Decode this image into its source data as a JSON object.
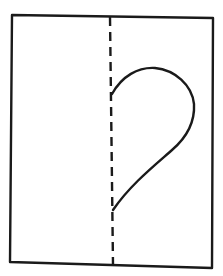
{
  "diagram": {
    "description": "Folded paper with half-heart outline drawn against the fold line",
    "stroke_color": "#1a1a1a",
    "background_color": "#ffffff",
    "paper": {
      "label": "paper-sheet",
      "corners": [
        [
          12,
          14
        ],
        [
          213,
          18
        ],
        [
          212,
          268
        ],
        [
          10,
          262
        ]
      ]
    },
    "fold_line": {
      "label": "fold-line",
      "style": "dashed",
      "from": [
        110,
        17
      ],
      "to": [
        113,
        265
      ]
    },
    "half_heart": {
      "label": "half-heart-outline",
      "top_point": [
        112,
        93
      ],
      "bottom_point": [
        112,
        212
      ]
    }
  }
}
